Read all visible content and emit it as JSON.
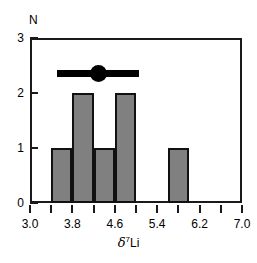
{
  "chart_data": {
    "type": "bar",
    "title": "",
    "subtitle": "",
    "xlabel_parts": {
      "symbol": "δ",
      "superscript": "7",
      "element": "Li"
    },
    "xlabel": "δ7Li",
    "ylabel": "N",
    "xlim": [
      3.0,
      7.0
    ],
    "ylim": [
      0,
      3
    ],
    "bin_width": 0.4,
    "grid": false,
    "legend": null,
    "x_tick_labels": [
      "3.0",
      "3.8",
      "4.6",
      "5.4",
      "6.2",
      "7.0"
    ],
    "x_tick_values": [
      3.0,
      3.8,
      4.6,
      5.4,
      6.2,
      7.0
    ],
    "x_minor_tick_values": [
      3.4,
      4.2,
      5.0,
      5.8,
      6.6
    ],
    "y_tick_labels": [
      "0",
      "1",
      "2",
      "3"
    ],
    "y_tick_values": [
      0,
      1,
      2,
      3
    ],
    "bins": [
      {
        "left": 3.4,
        "right": 3.8,
        "count": 1
      },
      {
        "left": 3.8,
        "right": 4.2,
        "count": 2
      },
      {
        "left": 4.2,
        "right": 4.6,
        "count": 1
      },
      {
        "left": 4.6,
        "right": 5.0,
        "count": 2
      },
      {
        "left": 5.6,
        "right": 6.0,
        "count": 1
      }
    ],
    "categories": [
      "3.4-3.8",
      "3.8-4.2",
      "4.2-4.6",
      "4.6-5.0",
      "5.6-6.0"
    ],
    "values": [
      1,
      2,
      1,
      2,
      1
    ],
    "annotations": [
      {
        "type": "mean-range-marker",
        "y": 2.35,
        "x_min": 3.5,
        "x_max": 5.05,
        "x_center": 4.3
      }
    ],
    "colors": {
      "bar_fill": "#808080",
      "bar_edge": "#111111",
      "axis": "#1a1a1a",
      "marker": "#000000",
      "background": "#ffffff"
    }
  }
}
